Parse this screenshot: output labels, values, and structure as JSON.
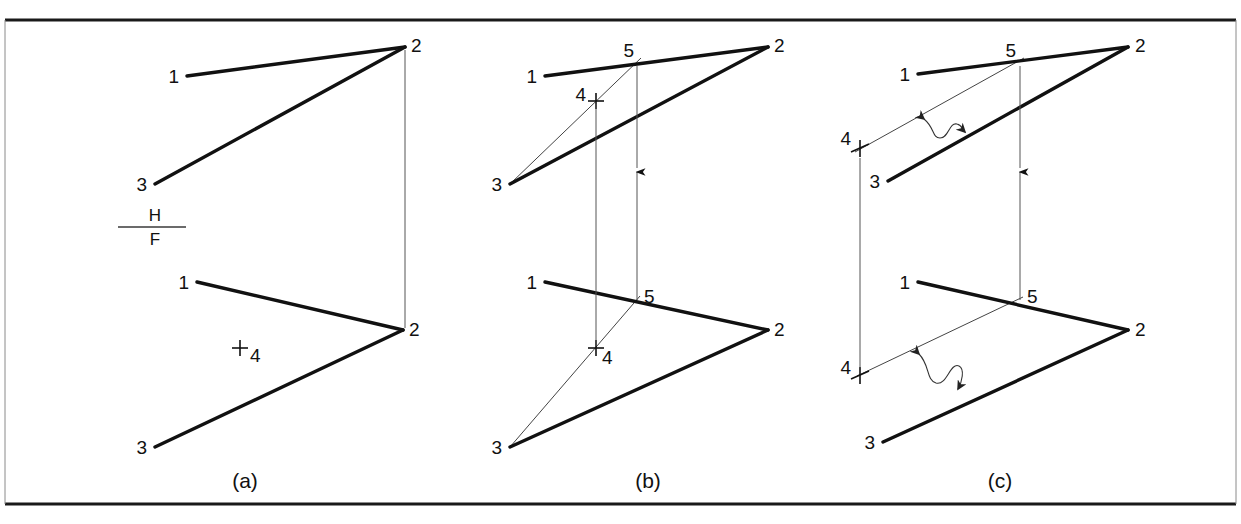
{
  "figure": {
    "background_color": "#ffffff",
    "ink_color": "#111111",
    "panels": [
      {
        "id": "a",
        "caption": "(a)",
        "caption_x": 245,
        "caption_y": 482,
        "fold_line": {
          "label_top": "H",
          "label_bottom": "F",
          "x1": 118,
          "x2": 186,
          "y": 227
        },
        "views": [
          {
            "name": "top-view",
            "points": [
              {
                "label": "1",
                "x": 187,
                "y": 76,
                "label_x": 179,
                "label_y": 78,
                "anchor": "end"
              },
              {
                "label": "2",
                "x": 405,
                "y": 47,
                "label_x": 411,
                "label_y": 46,
                "anchor": "start"
              },
              {
                "label": "3",
                "x": 155,
                "y": 184,
                "label_x": 147,
                "label_y": 186,
                "anchor": "end"
              }
            ],
            "edges": [
              [
                "1",
                "2"
              ],
              [
                "3",
                "2"
              ]
            ]
          },
          {
            "name": "front-view",
            "points": [
              {
                "label": "1",
                "x": 197,
                "y": 282,
                "label_x": 189,
                "label_y": 284,
                "anchor": "end"
              },
              {
                "label": "2",
                "x": 403,
                "y": 330,
                "label_x": 409,
                "label_y": 330,
                "anchor": "start"
              },
              {
                "label": "3",
                "x": 155,
                "y": 447,
                "label_x": 147,
                "label_y": 449,
                "anchor": "end"
              }
            ],
            "edges": [
              [
                "1",
                "2"
              ],
              [
                "3",
                "2"
              ]
            ],
            "cross_points": [
              {
                "label": "4",
                "x": 240,
                "y": 348,
                "label_x": 250,
                "label_y": 358,
                "anchor": "start"
              }
            ]
          }
        ],
        "projectors": [
          {
            "x1": 405,
            "y1": 50,
            "x2": 405,
            "y2": 328
          }
        ]
      },
      {
        "id": "b",
        "caption": "(b)",
        "caption_x": 648,
        "caption_y": 482,
        "views": [
          {
            "name": "top-view",
            "points": [
              {
                "label": "1",
                "x": 545,
                "y": 76,
                "label_x": 537,
                "label_y": 78,
                "anchor": "end"
              },
              {
                "label": "2",
                "x": 768,
                "y": 47,
                "label_x": 774,
                "label_y": 46,
                "anchor": "start"
              },
              {
                "label": "3",
                "x": 510,
                "y": 184,
                "label_x": 502,
                "label_y": 186,
                "anchor": "end"
              },
              {
                "label": "5",
                "x": 637,
                "y": 63,
                "label_x": 630,
                "label_y": 52,
                "anchor": "end"
              }
            ],
            "edges": [
              [
                "1",
                "2"
              ],
              [
                "3",
                "2"
              ]
            ],
            "construction_edges": [
              [
                "3",
                "5"
              ]
            ],
            "cross_points": [
              {
                "label": "4",
                "x": 596,
                "y": 101,
                "label_x": 588,
                "label_y": 100,
                "anchor": "end"
              }
            ]
          },
          {
            "name": "front-view",
            "points": [
              {
                "label": "1",
                "x": 545,
                "y": 282,
                "label_x": 537,
                "label_y": 284,
                "anchor": "end"
              },
              {
                "label": "2",
                "x": 768,
                "y": 330,
                "label_x": 774,
                "label_y": 330,
                "anchor": "start"
              },
              {
                "label": "3",
                "x": 510,
                "y": 447,
                "label_x": 502,
                "label_y": 449,
                "anchor": "end"
              },
              {
                "label": "5",
                "x": 637,
                "y": 300,
                "label_x": 644,
                "label_y": 297,
                "anchor": "start"
              }
            ],
            "edges": [
              [
                "1",
                "2"
              ],
              [
                "3",
                "2"
              ]
            ],
            "construction_edges": [
              [
                "3",
                "5"
              ]
            ],
            "cross_points": [
              {
                "label": "4",
                "x": 596,
                "y": 348,
                "label_x": 603,
                "label_y": 360,
                "anchor": "start"
              }
            ]
          }
        ],
        "projectors": [
          {
            "x1": 596,
            "y1": 104,
            "x2": 596,
            "y2": 346
          },
          {
            "x1": 637,
            "y1": 300,
            "x2": 637,
            "y2": 66,
            "arrow": "up",
            "arrow_y": 176
          }
        ]
      },
      {
        "id": "c",
        "caption": "(c)",
        "caption_x": 1000,
        "caption_y": 482,
        "views": [
          {
            "name": "top-view",
            "points": [
              {
                "label": "1",
                "x": 918,
                "y": 74,
                "label_x": 910,
                "label_y": 77,
                "anchor": "end"
              },
              {
                "label": "2",
                "x": 1128,
                "y": 47,
                "label_x": 1135,
                "label_y": 46,
                "anchor": "start"
              },
              {
                "label": "3",
                "x": 888,
                "y": 181,
                "label_x": 880,
                "label_y": 183,
                "anchor": "end"
              },
              {
                "label": "5",
                "x": 1020,
                "y": 64,
                "label_x": 1013,
                "label_y": 52,
                "anchor": "end"
              }
            ],
            "edges": [
              [
                "1",
                "2"
              ],
              [
                "3",
                "2"
              ]
            ],
            "construction_edges": [
              [
                "4",
                "5"
              ]
            ],
            "cross_points": [
              {
                "label": "4",
                "x": 860,
                "y": 148,
                "label_x": 853,
                "label_y": 140,
                "anchor": "end"
              }
            ],
            "squiggle_arrow": {
              "from_x": 922,
              "from_y": 118,
              "to_x": 966,
              "to_y": 132
            }
          },
          {
            "name": "front-view",
            "points": [
              {
                "label": "1",
                "x": 918,
                "y": 282,
                "label_x": 910,
                "label_y": 284,
                "anchor": "end"
              },
              {
                "label": "2",
                "x": 1128,
                "y": 330,
                "label_x": 1135,
                "label_y": 330,
                "anchor": "start"
              },
              {
                "label": "3",
                "x": 883,
                "y": 442,
                "label_x": 875,
                "label_y": 444,
                "anchor": "end"
              },
              {
                "label": "5",
                "x": 1020,
                "y": 300,
                "label_x": 1027,
                "label_y": 297,
                "anchor": "start"
              }
            ],
            "edges": [
              [
                "1",
                "2"
              ],
              [
                "3",
                "2"
              ]
            ],
            "construction_edges": [
              [
                "4",
                "5"
              ]
            ],
            "cross_points": [
              {
                "label": "4",
                "x": 860,
                "y": 375,
                "label_x": 853,
                "label_y": 369,
                "anchor": "end"
              }
            ],
            "squiggle_arrow": {
              "from_x": 916,
              "from_y": 352,
              "to_x": 960,
              "to_y": 392
            }
          }
        ],
        "projectors": [
          {
            "x1": 860,
            "y1": 152,
            "x2": 860,
            "y2": 372
          },
          {
            "x1": 1020,
            "y1": 300,
            "x2": 1020,
            "y2": 66,
            "arrow": "up",
            "arrow_y": 176
          }
        ]
      }
    ],
    "borders": {
      "top_y": 20,
      "bottom_y": 504,
      "left_x": 5,
      "right_x": 1236
    }
  }
}
